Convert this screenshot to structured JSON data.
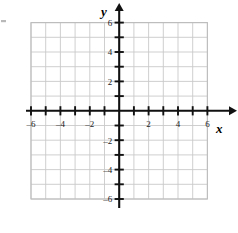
{
  "figure": {
    "kind": "cartesian-coordinate-grid",
    "background_color": "#ffffff",
    "grid_color": "#c9c9c9",
    "axis_color": "#111111",
    "label_color": "#1a1a1a"
  },
  "axes": {
    "x": {
      "name": "x",
      "min": -6,
      "max": 6,
      "tick_step": 1,
      "labeled_ticks": [
        -6,
        -4,
        -2,
        2,
        4,
        6
      ],
      "labels": [
        "–6",
        "–4",
        "–2",
        "2",
        "4",
        "6"
      ],
      "arrow": "right"
    },
    "y": {
      "name": "y",
      "min": -6,
      "max": 6,
      "tick_step": 1,
      "labeled_ticks": [
        6,
        4,
        2,
        -2,
        -4,
        -6
      ],
      "labels": [
        "6",
        "4",
        "2",
        "–2",
        "–4",
        "–6"
      ],
      "arrow": "up"
    }
  },
  "chart_data": {
    "type": "scatter",
    "title": "",
    "subtitle": "",
    "xlabel": "x",
    "ylabel": "y",
    "xlim": [
      -6,
      6
    ],
    "ylim": [
      -6,
      6
    ],
    "xticks": [
      -6,
      -5,
      -4,
      -3,
      -2,
      -1,
      0,
      1,
      2,
      3,
      4,
      5,
      6
    ],
    "yticks": [
      -6,
      -5,
      -4,
      -3,
      -2,
      -1,
      0,
      1,
      2,
      3,
      4,
      5,
      6
    ],
    "xticklabels": [
      "–6",
      "",
      "–4",
      "",
      "–2",
      "",
      "",
      "",
      "2",
      "",
      "4",
      "",
      "6"
    ],
    "yticklabels": [
      "–6",
      "",
      "–4",
      "",
      "–2",
      "",
      "",
      "",
      "2",
      "",
      "4",
      "",
      "6"
    ],
    "grid": true,
    "grid_spacing": 1,
    "legend": null,
    "series": [],
    "annotations": []
  }
}
